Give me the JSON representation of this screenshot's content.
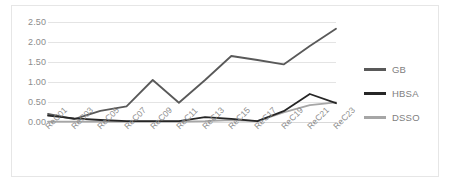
{
  "chart_data": {
    "type": "line",
    "title": "",
    "xlabel": "",
    "ylabel": "Errbest",
    "ylim": [
      0.0,
      2.5
    ],
    "yticks": [
      "0.00",
      "0.50",
      "1.00",
      "1.50",
      "2.00",
      "2.50"
    ],
    "ytick_values": [
      0.0,
      0.5,
      1.0,
      1.5,
      2.0,
      2.5
    ],
    "grid": true,
    "legend_position": "right",
    "categories": [
      "ReC01",
      "ReC03",
      "ReC05",
      "ReC07",
      "ReC09",
      "ReC11",
      "ReC13",
      "ReC15",
      "ReC17",
      "ReC19",
      "ReC21",
      "ReC23"
    ],
    "series": [
      {
        "name": "GB",
        "color": "#595959",
        "values": [
          0.2,
          0.07,
          0.28,
          0.39,
          1.05,
          0.48,
          1.05,
          1.65,
          1.55,
          1.44,
          1.9,
          2.33
        ]
      },
      {
        "name": "HBSA",
        "color": "#262626",
        "values": [
          0.16,
          0.09,
          0.05,
          0.02,
          0.02,
          0.02,
          0.12,
          0.08,
          0.02,
          0.27,
          0.7,
          0.47
        ]
      },
      {
        "name": "DSSO",
        "color": "#a6a6a6",
        "values": [
          0.01,
          0.01,
          0.01,
          0.01,
          0.01,
          0.01,
          0.02,
          0.05,
          0.02,
          0.24,
          0.42,
          0.49
        ]
      }
    ]
  },
  "legend": {
    "items": [
      {
        "label": "GB",
        "color": "#595959"
      },
      {
        "label": "HBSA",
        "color": "#262626"
      },
      {
        "label": "DSSO",
        "color": "#a6a6a6"
      }
    ]
  }
}
